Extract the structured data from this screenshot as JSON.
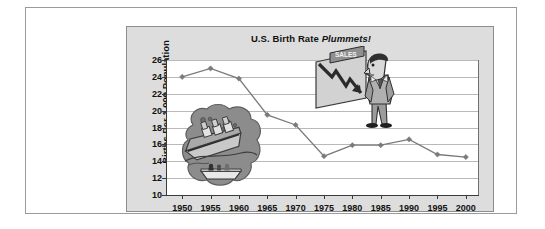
{
  "chart_data": {
    "type": "line",
    "title": "U.S. Birth Rate Plummets!",
    "title_plain": "U.S. Birth Rate",
    "title_emphasis": "Plummets!",
    "xlabel": "",
    "ylabel": "Births Per 1,000 Population",
    "categories": [
      "1950",
      "1955",
      "1960",
      "1965",
      "1970",
      "1975",
      "1980",
      "1985",
      "1990",
      "1995",
      "2000"
    ],
    "values": [
      24.0,
      25.0,
      23.8,
      19.5,
      18.3,
      14.6,
      15.9,
      15.9,
      16.6,
      14.8,
      14.5
    ],
    "ylim": [
      10,
      26
    ],
    "ytick_labels": [
      "26",
      "24",
      "22",
      "20",
      "18",
      "16",
      "14",
      "12",
      "10"
    ],
    "ytick_values": [
      26,
      24,
      22,
      20,
      18,
      16,
      14,
      12,
      10
    ],
    "grid": true,
    "grid_axis": "y",
    "legend": "none",
    "series_color": "#7a7a7a",
    "marker": "diamond"
  },
  "frame": {
    "page_background": "#ffffff",
    "border_color": "#9a9a9a",
    "panel_background": "#dddddd",
    "panel_border_color": "#8d8d8d",
    "plot_background": "#ffffff",
    "gridline_color": "#b9b9b9",
    "axis_color": "#3a3a3a",
    "text_color": "#111111"
  },
  "clipart": {
    "ship": {
      "name": "sinking-ship-illustration",
      "alt": "Sinking ocean liner with lifeboat",
      "blob_color": "#8c8c8c",
      "hull_color": "#b5b5b5",
      "water_color": "#6e6e6e"
    },
    "businessman": {
      "name": "businessman-with-sales-chart-illustration",
      "alt": "Businessman looking at a declining sales chart",
      "banner_label": "SALES",
      "board_color": "#d2d2d2",
      "arrow_color": "#2b2b2b",
      "banner_color": "#8f8f8f",
      "suit_color": "#9c9c9c",
      "hair_color": "#2f2f2f"
    }
  }
}
